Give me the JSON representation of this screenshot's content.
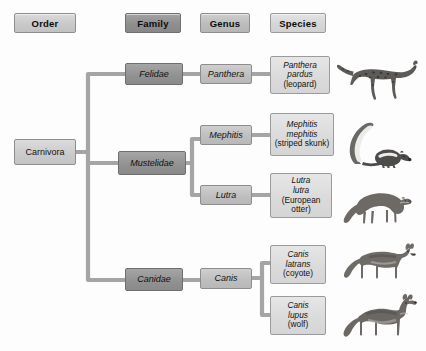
{
  "diagram": {
    "headers": [
      {
        "id": "order",
        "label": "Order"
      },
      {
        "id": "family",
        "label": "Family"
      },
      {
        "id": "genus",
        "label": "Genus"
      },
      {
        "id": "species",
        "label": "Species"
      }
    ],
    "colors": {
      "order_fill": "#cacaca",
      "family_fill": "#919191",
      "genus_fill": "#bebebe",
      "species_fill": "#dadada",
      "connector": "#a0a0a0",
      "border": "#8d8d8d",
      "background": "#fdfdfd",
      "text": "#121212"
    },
    "order": {
      "label": "Carnivora"
    },
    "families": [
      {
        "id": "felidae",
        "label": "Felidae"
      },
      {
        "id": "mustelidae",
        "label": "Mustelidae"
      },
      {
        "id": "canidae",
        "label": "Canidae"
      }
    ],
    "genera": [
      {
        "id": "panthera",
        "label": "Panthera"
      },
      {
        "id": "mephitis",
        "label": "Mephitis"
      },
      {
        "id": "lutra",
        "label": "Lutra"
      },
      {
        "id": "canis",
        "label": "Canis"
      }
    ],
    "species": [
      {
        "id": "panthera-pardus",
        "binomial_line1": "Panthera",
        "binomial_line2": "pardus",
        "common": "(leopard)",
        "animal": "leopard"
      },
      {
        "id": "mephitis-mephitis",
        "binomial_line1": "Mephitis",
        "binomial_line2": "mephitis",
        "common": "(striped skunk)",
        "animal": "striped-skunk"
      },
      {
        "id": "lutra-lutra",
        "binomial_line1": "Lutra",
        "binomial_line2": "lutra",
        "common": "(European otter)",
        "animal": "european-otter"
      },
      {
        "id": "canis-latrans",
        "binomial_line1": "Canis",
        "binomial_line2": "latrans",
        "common": "(coyote)",
        "animal": "coyote"
      },
      {
        "id": "canis-lupus",
        "binomial_line1": "Canis",
        "binomial_line2": "lupus",
        "common": "(wolf)",
        "animal": "wolf"
      }
    ]
  }
}
